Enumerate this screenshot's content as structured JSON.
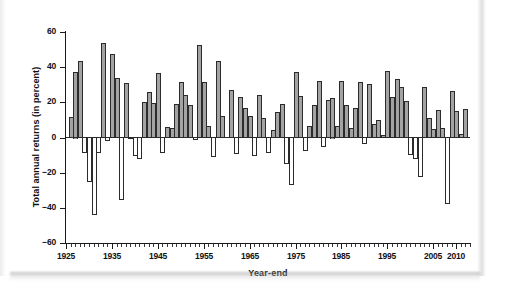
{
  "figure": {
    "xaxis_title": "Year-end",
    "yaxis_title": "Total annual returns (in percent)"
  },
  "chart_data": {
    "type": "bar",
    "title": "",
    "subtitle": "",
    "xlabel": "Year-end",
    "ylabel": "Total annual returns (in percent)",
    "xlim": [
      1925,
      2013
    ],
    "ylim": [
      -60,
      60
    ],
    "grid": false,
    "legend": null,
    "y_ticks": [
      60,
      40,
      20,
      0,
      -20,
      -40,
      -60
    ],
    "y_tick_labels": [
      "60",
      "40",
      "20",
      "0",
      "−20",
      "−40",
      "−60"
    ],
    "x_ticks": [
      1925,
      1935,
      1945,
      1955,
      1965,
      1975,
      1985,
      1995,
      2005,
      2010
    ],
    "x_tick_labels": [
      "1925",
      "1935",
      "1945",
      "1955",
      "1965",
      "1975",
      "1985",
      "1995",
      "2005",
      "2010"
    ],
    "x_minor_tick_interval": 1,
    "bar_fill_positive": "#a3a3a3",
    "bar_fill_negative": "#ffffff",
    "bar_outline": "#2b2b2b",
    "categories": [
      1926,
      1927,
      1928,
      1929,
      1930,
      1931,
      1932,
      1933,
      1934,
      1935,
      1936,
      1937,
      1938,
      1939,
      1940,
      1941,
      1942,
      1943,
      1944,
      1945,
      1946,
      1947,
      1948,
      1949,
      1950,
      1951,
      1952,
      1953,
      1954,
      1955,
      1956,
      1957,
      1958,
      1959,
      1960,
      1961,
      1962,
      1963,
      1964,
      1965,
      1966,
      1967,
      1968,
      1969,
      1970,
      1971,
      1972,
      1973,
      1974,
      1975,
      1976,
      1977,
      1978,
      1979,
      1980,
      1981,
      1982,
      1983,
      1984,
      1985,
      1986,
      1987,
      1988,
      1989,
      1990,
      1991,
      1992,
      1993,
      1994,
      1995,
      1996,
      1997,
      1998,
      1999,
      2000,
      2001,
      2002,
      2003,
      2004,
      2005,
      2006,
      2007,
      2008,
      2009,
      2010,
      2011,
      2012
    ],
    "values": [
      11.6,
      37.5,
      43.6,
      -8.4,
      -24.9,
      -43.3,
      -8.2,
      54.0,
      -1.4,
      47.7,
      33.9,
      -35.0,
      31.1,
      -0.4,
      -9.8,
      -11.6,
      20.3,
      25.9,
      19.8,
      36.4,
      -8.1,
      5.7,
      5.5,
      18.8,
      31.7,
      24.0,
      18.4,
      -1.0,
      52.6,
      31.6,
      6.6,
      -10.8,
      43.4,
      12.0,
      0.5,
      26.9,
      -8.7,
      22.8,
      16.5,
      12.5,
      -10.1,
      24.0,
      11.1,
      -8.5,
      4.0,
      14.3,
      19.0,
      -14.7,
      -26.5,
      37.2,
      23.8,
      -7.2,
      6.6,
      18.4,
      32.4,
      -4.9,
      21.4,
      22.5,
      6.3,
      32.2,
      18.5,
      5.2,
      16.8,
      31.5,
      -3.1,
      30.5,
      7.6,
      10.1,
      1.3,
      37.6,
      23.0,
      33.4,
      28.6,
      21.0,
      -9.1,
      -11.9,
      -22.1,
      28.7,
      10.9,
      4.9,
      15.8,
      5.5,
      -37.0,
      26.5,
      15.1,
      2.1,
      16.0
    ]
  }
}
